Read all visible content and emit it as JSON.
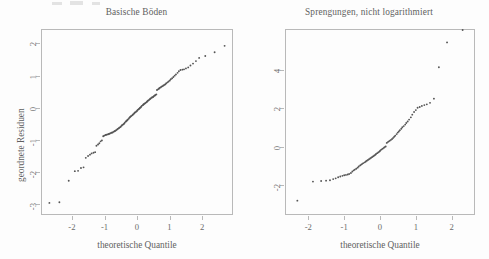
{
  "figure": {
    "background": "#fdfdfd",
    "point_color": "#555555",
    "axis_color": "#b9b9b9",
    "text_color": "#5f5f5f",
    "scan_artifacts": [
      {
        "x": 52,
        "y": 2,
        "w": 10,
        "h": 3
      },
      {
        "x": 70,
        "y": 1,
        "w": 13,
        "h": 4
      },
      {
        "x": 92,
        "y": 2,
        "w": 8,
        "h": 3
      }
    ]
  },
  "chart_data": [
    {
      "type": "scatter",
      "panel": "left",
      "title": "Basische Böden",
      "xlabel": "theoretische Quantile",
      "ylabel": "geordnete Residuen",
      "xlim": [
        -2.95,
        2.95
      ],
      "ylim": [
        -3.35,
        2.45
      ],
      "xticks": [
        -2,
        -1,
        0,
        1,
        2
      ],
      "xticklabels": [
        "-2",
        "-1",
        "0",
        "1",
        "2"
      ],
      "yticks": [
        2,
        1,
        0,
        -1,
        -2,
        -3
      ],
      "yticklabels": [
        "2",
        "1",
        "0",
        "-1",
        "-2",
        "-3"
      ],
      "grid": false,
      "legend": null,
      "x": [
        -2.72,
        -2.41,
        -2.12,
        -1.93,
        -1.83,
        -1.74,
        -1.66,
        -1.59,
        -1.52,
        -1.46,
        -1.41,
        -1.35,
        -1.3,
        -1.26,
        -1.21,
        -1.17,
        -1.13,
        -1.09,
        -1.05,
        -1.02,
        -0.98,
        -0.95,
        -0.91,
        -0.88,
        -0.85,
        -0.82,
        -0.79,
        -0.76,
        -0.73,
        -0.7,
        -0.68,
        -0.65,
        -0.62,
        -0.6,
        -0.57,
        -0.55,
        -0.52,
        -0.5,
        -0.47,
        -0.45,
        -0.42,
        -0.4,
        -0.38,
        -0.35,
        -0.33,
        -0.31,
        -0.29,
        -0.26,
        -0.24,
        -0.22,
        -0.2,
        -0.18,
        -0.15,
        -0.13,
        -0.11,
        -0.09,
        -0.07,
        -0.05,
        -0.02,
        0.0,
        0.02,
        0.05,
        0.07,
        0.09,
        0.11,
        0.13,
        0.15,
        0.18,
        0.2,
        0.22,
        0.24,
        0.26,
        0.29,
        0.31,
        0.33,
        0.35,
        0.38,
        0.4,
        0.42,
        0.45,
        0.47,
        0.5,
        0.52,
        0.55,
        0.57,
        0.6,
        0.62,
        0.65,
        0.68,
        0.7,
        0.73,
        0.76,
        0.79,
        0.82,
        0.85,
        0.88,
        0.91,
        0.95,
        0.98,
        1.02,
        1.05,
        1.09,
        1.13,
        1.17,
        1.21,
        1.26,
        1.3,
        1.35,
        1.41,
        1.46,
        1.52,
        1.59,
        1.66,
        1.74,
        1.83,
        1.93,
        2.12,
        2.41,
        2.72
      ],
      "y": [
        -3.0,
        -2.98,
        -2.3,
        -2.0,
        -1.99,
        -1.9,
        -1.88,
        -1.58,
        -1.52,
        -1.48,
        -1.44,
        -1.42,
        -1.4,
        -1.2,
        -1.16,
        -1.12,
        -1.06,
        -1.03,
        -0.9,
        -0.88,
        -0.86,
        -0.85,
        -0.84,
        -0.83,
        -0.82,
        -0.8,
        -0.79,
        -0.78,
        -0.76,
        -0.74,
        -0.73,
        -0.71,
        -0.69,
        -0.67,
        -0.65,
        -0.63,
        -0.61,
        -0.59,
        -0.56,
        -0.54,
        -0.52,
        -0.5,
        -0.47,
        -0.44,
        -0.42,
        -0.4,
        -0.38,
        -0.35,
        -0.32,
        -0.3,
        -0.28,
        -0.26,
        -0.24,
        -0.22,
        -0.2,
        -0.18,
        -0.16,
        -0.14,
        -0.12,
        -0.1,
        -0.07,
        -0.05,
        -0.03,
        -0.01,
        0.01,
        0.03,
        0.06,
        0.08,
        0.1,
        0.12,
        0.13,
        0.15,
        0.17,
        0.19,
        0.21,
        0.23,
        0.25,
        0.27,
        0.29,
        0.31,
        0.33,
        0.34,
        0.36,
        0.38,
        0.4,
        0.42,
        0.56,
        0.58,
        0.6,
        0.62,
        0.64,
        0.66,
        0.68,
        0.7,
        0.72,
        0.74,
        0.77,
        0.8,
        0.83,
        0.86,
        0.9,
        0.93,
        0.97,
        1.01,
        1.05,
        1.1,
        1.15,
        1.19,
        1.2,
        1.21,
        1.24,
        1.27,
        1.33,
        1.39,
        1.47,
        1.57,
        1.63,
        1.75,
        1.95,
        2.08
      ]
    },
    {
      "type": "scatter",
      "panel": "right",
      "title": "Sprengungen, nicht logarithmiert",
      "xlabel": "theoretische Quantile",
      "ylabel": "",
      "xlim": [
        -2.65,
        2.65
      ],
      "ylim": [
        -3.55,
        6.1
      ],
      "xticks": [
        -2,
        -1,
        0,
        1,
        2
      ],
      "xticklabels": [
        "-2",
        "-1",
        "0",
        "1",
        "2"
      ],
      "yticks": [
        4,
        2,
        0,
        -2
      ],
      "yticklabels": [
        "4",
        "2",
        "0",
        "-2"
      ],
      "grid": false,
      "legend": null,
      "x": [
        -2.33,
        -1.89,
        -1.66,
        -1.52,
        -1.41,
        -1.32,
        -1.25,
        -1.18,
        -1.12,
        -1.06,
        -1.01,
        -0.96,
        -0.91,
        -0.87,
        -0.82,
        -0.78,
        -0.74,
        -0.71,
        -0.67,
        -0.63,
        -0.6,
        -0.56,
        -0.53,
        -0.5,
        -0.47,
        -0.43,
        -0.4,
        -0.37,
        -0.34,
        -0.31,
        -0.28,
        -0.25,
        -0.22,
        -0.19,
        -0.16,
        -0.13,
        -0.11,
        -0.08,
        -0.05,
        -0.02,
        0.0,
        0.02,
        0.05,
        0.08,
        0.11,
        0.13,
        0.16,
        0.19,
        0.22,
        0.25,
        0.28,
        0.31,
        0.34,
        0.37,
        0.4,
        0.43,
        0.47,
        0.5,
        0.53,
        0.56,
        0.6,
        0.63,
        0.67,
        0.71,
        0.74,
        0.78,
        0.82,
        0.87,
        0.91,
        0.96,
        1.01,
        1.06,
        1.12,
        1.18,
        1.25,
        1.32,
        1.41,
        1.52,
        1.66,
        1.89,
        2.33
      ],
      "y": [
        -2.85,
        -1.85,
        -1.82,
        -1.8,
        -1.78,
        -1.72,
        -1.68,
        -1.62,
        -1.58,
        -1.55,
        -1.52,
        -1.5,
        -1.48,
        -1.45,
        -1.4,
        -1.32,
        -1.26,
        -1.22,
        -1.18,
        -1.12,
        -1.06,
        -1.0,
        -0.96,
        -0.92,
        -0.88,
        -0.84,
        -0.8,
        -0.76,
        -0.72,
        -0.68,
        -0.64,
        -0.6,
        -0.56,
        -0.52,
        -0.48,
        -0.44,
        -0.4,
        -0.36,
        -0.32,
        -0.28,
        -0.24,
        -0.2,
        -0.16,
        -0.12,
        -0.08,
        -0.04,
        -0.01,
        0.18,
        0.22,
        0.26,
        0.3,
        0.34,
        0.38,
        0.44,
        0.5,
        0.56,
        0.64,
        0.72,
        0.78,
        0.84,
        0.92,
        1.0,
        1.06,
        1.14,
        1.22,
        1.3,
        1.4,
        1.52,
        1.66,
        1.8,
        1.9,
        2.02,
        2.06,
        2.12,
        2.16,
        2.2,
        2.28,
        2.5,
        4.15,
        5.45
      ]
    }
  ]
}
